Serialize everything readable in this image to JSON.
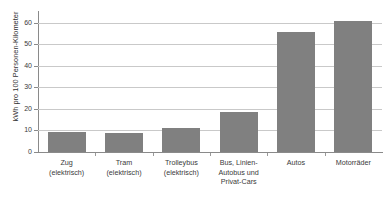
{
  "chart_data": {
    "type": "bar",
    "title": "",
    "subtitle": "",
    "xlabel": "",
    "ylabel": "kWh pro 100 Personen-Kilometer",
    "ylim": [
      0,
      65
    ],
    "yticks": [
      0,
      10,
      20,
      30,
      40,
      50,
      60
    ],
    "ytick_labels": [
      "0",
      "10",
      "20",
      "30",
      "40",
      "50",
      "60"
    ],
    "grid": true,
    "legend": false,
    "legend_position": "none",
    "bar_color": "#808080",
    "gridline_color": "#c9c9c9",
    "axis_color": "#8a8a8a",
    "categories": [
      "Zug (elektrisch)",
      "Tram (elektrisch)",
      "Trolleybus (elektrisch)",
      "Bus, Linien-Autobus und Privat-Cars",
      "Autos",
      "Motorräder"
    ],
    "category_lines": [
      [
        "Zug",
        "(elektrisch)"
      ],
      [
        "Tram",
        "(elektrisch)"
      ],
      [
        "Trolleybus",
        "(elektrisch)"
      ],
      [
        "Bus, Linien-",
        "Autobus und",
        "Privat-Cars"
      ],
      [
        "Autos"
      ],
      [
        "Motorräder"
      ]
    ],
    "values": [
      9.3,
      8.7,
      11.0,
      18.5,
      55.5,
      61.0
    ]
  }
}
